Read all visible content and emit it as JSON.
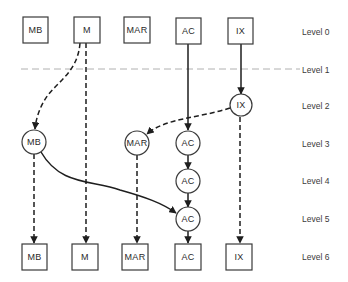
{
  "diagram": {
    "levels": [
      {
        "label": "Level 0",
        "y": 32
      },
      {
        "label": "Level 1",
        "y": 70
      },
      {
        "label": "Level 2",
        "y": 106
      },
      {
        "label": "Level 3",
        "y": 144
      },
      {
        "label": "Level 4",
        "y": 181
      },
      {
        "label": "Level 5",
        "y": 219
      },
      {
        "label": "Level 6",
        "y": 257
      }
    ],
    "top_boxes": [
      {
        "label": "MB"
      },
      {
        "label": "M"
      },
      {
        "label": "MAR"
      },
      {
        "label": "AC"
      },
      {
        "label": "IX"
      }
    ],
    "circles": [
      {
        "label": "IX",
        "level": 2
      },
      {
        "label": "MB",
        "level": 3
      },
      {
        "label": "MAR",
        "level": 3
      },
      {
        "label": "AC",
        "level": 3
      },
      {
        "label": "AC",
        "level": 4
      },
      {
        "label": "AC",
        "level": 5
      }
    ],
    "bottom_boxes": [
      {
        "label": "MB"
      },
      {
        "label": "M"
      },
      {
        "label": "MAR"
      },
      {
        "label": "AC"
      },
      {
        "label": "IX"
      }
    ],
    "edges": [
      {
        "from": "M (Level 0)",
        "to": "MB (Level 3)",
        "style": "dashed"
      },
      {
        "from": "M (Level 0)",
        "to": "M (Level 6)",
        "style": "dashed"
      },
      {
        "from": "AC (Level 0)",
        "to": "AC (Level 3)",
        "style": "solid"
      },
      {
        "from": "IX (Level 0)",
        "to": "IX (Level 2)",
        "style": "solid"
      },
      {
        "from": "IX (Level 2)",
        "to": "MAR (Level 3)",
        "style": "dashed"
      },
      {
        "from": "IX (Level 2)",
        "to": "IX (Level 6)",
        "style": "dashed"
      },
      {
        "from": "MB (Level 3)",
        "to": "AC (Level 5)",
        "style": "solid"
      },
      {
        "from": "MB (Level 3)",
        "to": "MB (Level 6)",
        "style": "dashed"
      },
      {
        "from": "MAR (Level 3)",
        "to": "MAR (Level 6)",
        "style": "dashed"
      },
      {
        "from": "AC (Level 3)",
        "to": "AC (Level 4)",
        "style": "solid"
      },
      {
        "from": "AC (Level 4)",
        "to": "AC (Level 5)",
        "style": "solid"
      },
      {
        "from": "AC (Level 5)",
        "to": "AC (Level 6)",
        "style": "solid"
      }
    ]
  }
}
